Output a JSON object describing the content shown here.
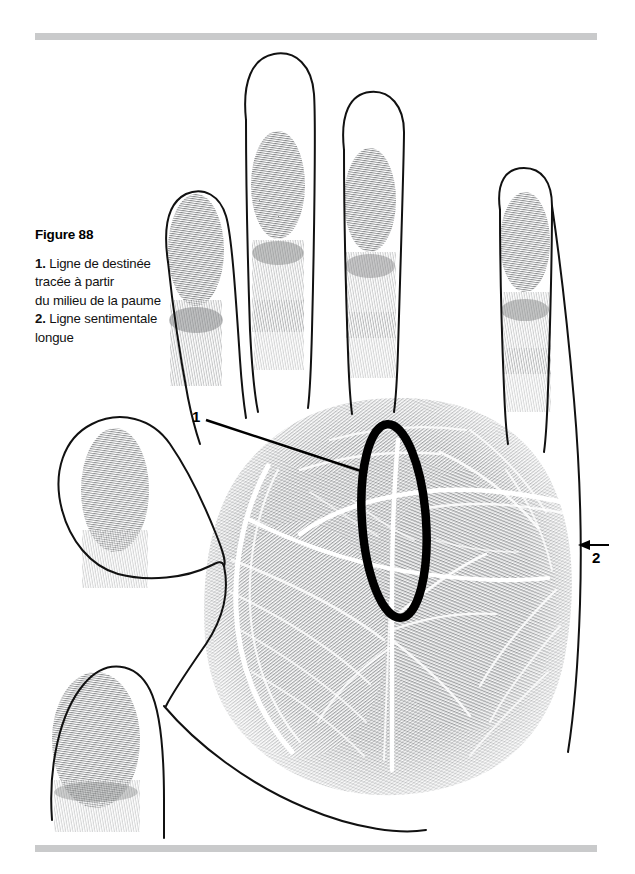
{
  "figure": {
    "title": "Figure 88",
    "caption_lines": [
      {
        "num": "1.",
        "text": "Ligne de destinée"
      },
      {
        "num": "",
        "text": "tracée à partir"
      },
      {
        "num": "",
        "text": "du milieu de la paume"
      },
      {
        "num": "2.",
        "text": "Ligne sentimentale"
      },
      {
        "num": "",
        "text": "longue"
      }
    ],
    "callouts": [
      {
        "label": "1",
        "meaning": "ligne-de-destinee-marker"
      },
      {
        "label": "2",
        "meaning": "ligne-sentimentale-marker"
      }
    ],
    "colors": {
      "rule_gray": "#c9cacb",
      "ink_black": "#000000",
      "print_gray": "#8d8f91",
      "background": "#ffffff"
    }
  }
}
